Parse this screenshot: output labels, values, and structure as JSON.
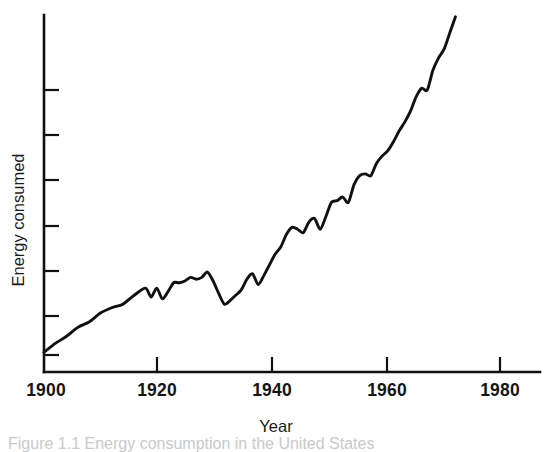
{
  "figure": {
    "background_color": "#ffffff",
    "ink_color": "#111111",
    "caption_partial": "Figure 1.1   Energy consumption in the United States"
  },
  "chart_data": {
    "type": "line",
    "title": "",
    "subtitle": "",
    "xlabel": "Year",
    "ylabel": "Energy consumed",
    "xlim": [
      1900,
      1988
    ],
    "ylim": [
      0,
      100
    ],
    "grid": false,
    "legend": false,
    "legend_position": "none",
    "x_ticks": [
      1920,
      1940,
      1960,
      1980
    ],
    "x_tick_labels": [
      "1920",
      "1940",
      "1960",
      "1980"
    ],
    "x_axis_start_label": "1900",
    "y_ticks": [
      15,
      28,
      41,
      54,
      67,
      80,
      93
    ],
    "y_tick_labels": [
      "",
      "",
      "",
      "",
      "",
      "",
      ""
    ],
    "y_axis_unlabeled": true,
    "series": [
      {
        "name": "Energy consumed",
        "x": [
          1900,
          1902,
          1904,
          1906,
          1908,
          1910,
          1912,
          1914,
          1916,
          1918,
          1919,
          1920,
          1921,
          1922,
          1923,
          1924,
          1925,
          1926,
          1927,
          1928,
          1929,
          1930,
          1931,
          1932,
          1933,
          1934,
          1935,
          1936,
          1937,
          1938,
          1939,
          1940,
          1941,
          1942,
          1943,
          1944,
          1945,
          1946,
          1947,
          1948,
          1949,
          1950,
          1951,
          1952,
          1953,
          1954,
          1955,
          1956,
          1957,
          1958,
          1959,
          1960,
          1961,
          1962,
          1963,
          1964,
          1965,
          1966,
          1967,
          1968,
          1969,
          1970,
          1971,
          1972,
          1973
        ],
        "values": [
          5.5,
          8.0,
          10.0,
          12.5,
          14.0,
          16.5,
          18.0,
          19.0,
          21.5,
          23.5,
          21.0,
          23.5,
          20.5,
          22.5,
          25.0,
          25.0,
          25.5,
          26.5,
          26.0,
          26.5,
          28.0,
          25.5,
          22.0,
          19.0,
          20.0,
          21.5,
          23.0,
          26.0,
          27.5,
          24.5,
          27.0,
          30.0,
          33.0,
          35.0,
          38.5,
          40.5,
          40.0,
          39.0,
          42.0,
          43.0,
          40.0,
          43.5,
          47.5,
          48.0,
          49.0,
          47.5,
          52.5,
          55.0,
          55.5,
          55.0,
          58.5,
          60.5,
          62.0,
          64.5,
          67.5,
          70.0,
          73.0,
          77.0,
          79.5,
          79.0,
          84.5,
          88.0,
          90.5,
          95.0,
          99.5
        ]
      }
    ]
  }
}
